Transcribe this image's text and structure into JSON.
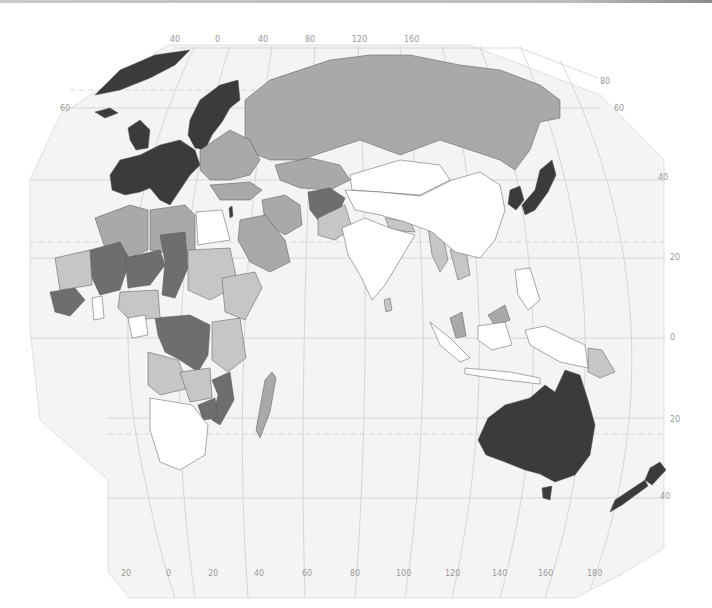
{
  "map": {
    "projection": "world map (Eastern Hemisphere: Europe, Africa, Asia, Oceania)",
    "colors": {
      "background": "#ffffff",
      "ocean": "#f4f4f4",
      "graticule": "#c9c9c9",
      "label": "#9a9a9a",
      "class_darkest": "#3b3b3b",
      "class_dark": "#6e6e6e",
      "class_medium": "#a9a9a9",
      "class_light": "#c6c6c6",
      "class_lightest": "#ffffff"
    },
    "top_longitude_labels": [
      "40",
      "0",
      "40",
      "80",
      "120",
      "160"
    ],
    "bottom_longitude_labels": [
      "20",
      "0",
      "20",
      "40",
      "60",
      "80",
      "100",
      "120",
      "140",
      "160",
      "180"
    ],
    "left_latitude_labels": [
      "60"
    ],
    "right_latitude_labels": [
      "80",
      "60",
      "40",
      "20",
      "0",
      "20",
      "40"
    ],
    "regions": [
      {
        "name": "Greenland",
        "class": "darkest"
      },
      {
        "name": "Western Europe",
        "class": "darkest"
      },
      {
        "name": "Scandinavia",
        "class": "darkest"
      },
      {
        "name": "Japan",
        "class": "darkest"
      },
      {
        "name": "South Korea",
        "class": "darkest"
      },
      {
        "name": "Australia",
        "class": "darkest"
      },
      {
        "name": "New Zealand",
        "class": "darkest"
      },
      {
        "name": "Israel",
        "class": "darkest"
      },
      {
        "name": "Russia",
        "class": "medium"
      },
      {
        "name": "Kazakhstan",
        "class": "medium"
      },
      {
        "name": "Eastern Europe",
        "class": "medium"
      },
      {
        "name": "Turkey",
        "class": "medium"
      },
      {
        "name": "Iran",
        "class": "medium"
      },
      {
        "name": "Saudi Arabia",
        "class": "medium"
      },
      {
        "name": "Algeria",
        "class": "medium"
      },
      {
        "name": "Libya",
        "class": "medium"
      },
      {
        "name": "Afghanistan",
        "class": "dark"
      },
      {
        "name": "Pakistan",
        "class": "light"
      },
      {
        "name": "Mali",
        "class": "dark"
      },
      {
        "name": "Niger",
        "class": "dark"
      },
      {
        "name": "Chad",
        "class": "dark"
      },
      {
        "name": "DR Congo",
        "class": "dark"
      },
      {
        "name": "Mozambique",
        "class": "dark"
      },
      {
        "name": "Zimbabwe",
        "class": "dark"
      },
      {
        "name": "Sudan",
        "class": "light"
      },
      {
        "name": "Ethiopia",
        "class": "light"
      },
      {
        "name": "Angola",
        "class": "light"
      },
      {
        "name": "Madagascar",
        "class": "medium"
      },
      {
        "name": "Egypt",
        "class": "lightest"
      },
      {
        "name": "China",
        "class": "lightest"
      },
      {
        "name": "Mongolia",
        "class": "lightest"
      },
      {
        "name": "India",
        "class": "lightest"
      },
      {
        "name": "South Africa",
        "class": "lightest"
      },
      {
        "name": "Indonesia",
        "class": "lightest"
      },
      {
        "name": "Myanmar",
        "class": "light"
      },
      {
        "name": "Papua New Guinea",
        "class": "light"
      },
      {
        "name": "Malaysia",
        "class": "medium"
      }
    ]
  }
}
